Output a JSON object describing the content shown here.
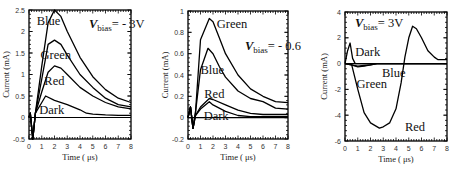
{
  "chart_data": [
    {
      "type": "line",
      "title": "V_bias = -3V",
      "annotation": {
        "v": "V",
        "sub": "bias",
        "rest": "= - 3V"
      },
      "xlabel": "Time ( μs)",
      "ylabel": "Current (mA)",
      "xlim": [
        0,
        8
      ],
      "ylim": [
        -0.5,
        2.5
      ],
      "xticks": [
        0,
        1,
        2,
        3,
        4,
        5,
        6,
        7,
        8
      ],
      "yticks": [
        -0.5,
        0,
        0.5,
        1,
        1.5,
        2,
        2.5
      ],
      "ytick_labels": [
        "-0.5",
        "0",
        "0.5",
        "1",
        "1.5",
        "2",
        "2.5"
      ],
      "grid": false,
      "legend": "inline labels",
      "series": [
        {
          "name": "Blue",
          "x": [
            0,
            0.1,
            0.3,
            0.5,
            1,
            1.5,
            2,
            2.5,
            3,
            4,
            5,
            6,
            7,
            8
          ],
          "y": [
            0,
            0.1,
            -0.5,
            0.1,
            1.2,
            2.2,
            2.5,
            2.35,
            2.0,
            1.4,
            0.95,
            0.65,
            0.45,
            0.35
          ],
          "label_pos": [
            0.6,
            2.25
          ]
        },
        {
          "name": "Green",
          "x": [
            0,
            0.1,
            0.3,
            0.5,
            1,
            1.5,
            2,
            2.5,
            3,
            4,
            5,
            6,
            7,
            8
          ],
          "y": [
            0,
            0.1,
            -0.5,
            0.1,
            0.9,
            1.7,
            1.8,
            1.7,
            1.45,
            1.0,
            0.7,
            0.45,
            0.3,
            0.25
          ],
          "label_pos": [
            0.9,
            1.45
          ]
        },
        {
          "name": "Red",
          "x": [
            0,
            0.1,
            0.3,
            0.5,
            1,
            1.5,
            2,
            2.5,
            3,
            4,
            5,
            6,
            7,
            8
          ],
          "y": [
            0,
            0.1,
            -0.5,
            0.1,
            0.6,
            1.05,
            1.2,
            1.15,
            1.0,
            0.7,
            0.5,
            0.35,
            0.25,
            0.2
          ],
          "label_pos": [
            1.2,
            0.85
          ]
        },
        {
          "name": "Dark",
          "x": [
            0,
            0.1,
            0.3,
            0.5,
            1,
            1.3,
            2,
            3,
            4,
            4.5,
            5,
            6,
            7,
            8
          ],
          "y": [
            0,
            0.1,
            -0.5,
            0.1,
            0.35,
            0.5,
            0.4,
            0.3,
            0.18,
            0.1,
            0.08,
            0.06,
            0.05,
            0.05
          ],
          "label_pos": [
            0.8,
            0.18
          ]
        }
      ]
    },
    {
      "type": "line",
      "title": "V_bias = -0.6",
      "annotation": {
        "v": "V",
        "sub": "bias",
        "rest": "= - 0.6"
      },
      "xlabel": "Time ( μs)",
      "ylabel": "Current (mA)",
      "xlim": [
        0,
        8
      ],
      "ylim": [
        -0.2,
        1
      ],
      "xticks": [
        0,
        1,
        2,
        3,
        4,
        5,
        6,
        7,
        8
      ],
      "yticks": [
        -0.2,
        0,
        0.2,
        0.4,
        0.6,
        0.8,
        1
      ],
      "ytick_labels": [
        "-0.2",
        "0",
        "0.2",
        "0.4",
        "0.6",
        "0.8",
        "1"
      ],
      "grid": false,
      "legend": "inline labels",
      "series": [
        {
          "name": "Green",
          "x": [
            0,
            0.2,
            0.4,
            0.6,
            1,
            1.7,
            2,
            2.5,
            3,
            4,
            5,
            6,
            7,
            8
          ],
          "y": [
            0,
            0.1,
            -0.1,
            0.05,
            0.73,
            0.93,
            0.9,
            0.75,
            0.6,
            0.4,
            0.27,
            0.2,
            0.15,
            0.14
          ],
          "label_pos": [
            2.3,
            0.88
          ]
        },
        {
          "name": "Blue",
          "x": [
            0,
            0.2,
            0.4,
            0.6,
            1,
            1.6,
            2,
            2.5,
            3,
            4,
            5,
            6,
            7,
            8
          ],
          "y": [
            0,
            0.1,
            -0.1,
            0.05,
            0.45,
            0.65,
            0.6,
            0.48,
            0.38,
            0.25,
            0.18,
            0.15,
            0.09,
            0.08
          ],
          "label_pos": [
            1.0,
            0.45
          ]
        },
        {
          "name": "Red",
          "x": [
            0,
            0.2,
            0.4,
            0.6,
            1,
            1.7,
            2,
            3,
            4,
            5,
            6,
            7,
            8
          ],
          "y": [
            0,
            0.1,
            -0.1,
            0.02,
            0.1,
            0.18,
            0.17,
            0.12,
            0.07,
            0.04,
            0.03,
            0.03,
            0.03
          ],
          "label_pos": [
            1.3,
            0.22
          ]
        },
        {
          "name": "Dark",
          "x": [
            0,
            0.2,
            0.4,
            0.6,
            1,
            1.7,
            2,
            3,
            4,
            5,
            6,
            7,
            8
          ],
          "y": [
            0,
            0.1,
            -0.1,
            0.02,
            0.08,
            0.15,
            0.12,
            0.06,
            0.02,
            0.01,
            0.01,
            0.01,
            0.01
          ],
          "label_pos": [
            1.25,
            0.02
          ]
        }
      ]
    },
    {
      "type": "line",
      "title": "V_bias = 3V",
      "annotation": {
        "v": "V",
        "sub": "bias",
        "rest": "= 3V"
      },
      "xlabel": "Time ( μs)",
      "ylabel": "Current (mA)",
      "xlim": [
        0,
        8
      ],
      "ylim": [
        -6,
        4
      ],
      "xticks": [
        0,
        1,
        2,
        3,
        4,
        5,
        6,
        7,
        8
      ],
      "yticks": [
        -6,
        -4,
        -2,
        0,
        2,
        4
      ],
      "ytick_labels": [
        "-6",
        "-4",
        "-2",
        "0",
        "2",
        "4"
      ],
      "grid": false,
      "legend": "inline labels",
      "series": [
        {
          "name": "Dark",
          "x": [
            0,
            0.2,
            0.4,
            0.6,
            0.8,
            1,
            2,
            8
          ],
          "y": [
            0,
            1.0,
            1.6,
            0.4,
            0,
            0,
            0,
            0
          ],
          "label_pos": [
            0.8,
            0.9
          ]
        },
        {
          "name": "Blue",
          "x": [
            0,
            0.5,
            1,
            1.5,
            2,
            2.5,
            8
          ],
          "y": [
            0,
            -0.1,
            -0.2,
            -0.15,
            -0.1,
            0,
            0
          ],
          "label_pos": [
            2.9,
            -0.75
          ]
        },
        {
          "name": "Green",
          "x": [
            0,
            0.5,
            1,
            1.5,
            2,
            2.5,
            8
          ],
          "y": [
            0,
            -0.1,
            -0.25,
            -0.2,
            -0.1,
            0,
            0
          ],
          "label_pos": [
            0.9,
            -1.6
          ]
        },
        {
          "name": "Red",
          "x": [
            0,
            0.5,
            1,
            1.5,
            2,
            2.7,
            3,
            3.5,
            4,
            4.4,
            4.7,
            5,
            5.3,
            5.6,
            6,
            6.5,
            7,
            7.3,
            8
          ],
          "y": [
            0,
            0,
            -2.0,
            -3.8,
            -4.6,
            -5.0,
            -4.9,
            -4.6,
            -3.5,
            -1.5,
            0.5,
            2.0,
            2.9,
            2.7,
            2.0,
            1.0,
            0.5,
            0.3,
            0.3
          ],
          "label_pos": [
            4.7,
            -4.9
          ]
        }
      ]
    }
  ],
  "axes": {
    "xlabel": "Time ( μs)",
    "ylabel": "Current (mA)"
  },
  "colors": {
    "line": "#000000",
    "text": "#111111",
    "background": "#ffffff"
  }
}
